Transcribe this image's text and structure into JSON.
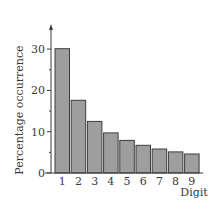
{
  "chart_data": {
    "type": "bar",
    "title": "",
    "xlabel": "Digit",
    "ylabel": "Percentage occurrence",
    "categories": [
      "1",
      "2",
      "3",
      "4",
      "5",
      "6",
      "7",
      "8",
      "9"
    ],
    "values": [
      30.1,
      17.6,
      12.5,
      9.7,
      7.9,
      6.7,
      5.8,
      5.1,
      4.6
    ],
    "ylim": [
      0,
      35
    ],
    "yticks": [
      0,
      10,
      20,
      30
    ],
    "yticks_minor": [
      5,
      15,
      25
    ],
    "grid": false,
    "legend": null,
    "bar_color": "#9e9e9e",
    "bar_edge_color": "#3c3c3c"
  },
  "labels": {
    "ylabel": "Percentage occurrence",
    "xlabel": "Digit",
    "yticks": [
      "0",
      "10",
      "20",
      "30"
    ],
    "xticks": [
      "1",
      "2",
      "3",
      "4",
      "5",
      "6",
      "7",
      "8",
      "9"
    ]
  }
}
